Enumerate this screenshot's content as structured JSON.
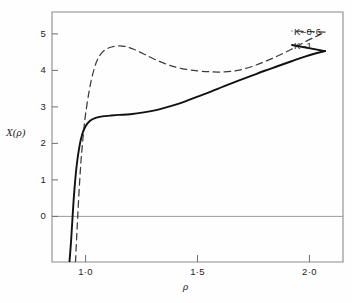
{
  "chart_data": {
    "type": "line",
    "title": "",
    "subtitle": "",
    "xlabel": "ρ",
    "ylabel": "X(ρ)",
    "xlim": [
      0.85,
      2.15
    ],
    "ylim": [
      -1.25,
      5.6
    ],
    "grid": false,
    "legend_position": "inside-top-right",
    "zero_line": true,
    "xticks": [
      {
        "value": 1.0,
        "label": "1·0"
      },
      {
        "value": 1.5,
        "label": "1·5"
      },
      {
        "value": 2.0,
        "label": "2·0"
      }
    ],
    "yticks": [
      {
        "value": 0,
        "label": "0"
      },
      {
        "value": 1,
        "label": "1"
      },
      {
        "value": 2,
        "label": "2"
      },
      {
        "value": 3,
        "label": "3"
      },
      {
        "value": 4,
        "label": "4"
      },
      {
        "value": 5,
        "label": "5"
      }
    ],
    "series": [
      {
        "name": "K=0·6",
        "label": "K–0·6",
        "style": "dashed",
        "color": "#3b3b3b",
        "points": [
          [
            0.955,
            -1.25
          ],
          [
            0.96,
            -0.6
          ],
          [
            0.965,
            0.0
          ],
          [
            0.972,
            0.8
          ],
          [
            0.98,
            1.55
          ],
          [
            0.99,
            2.25
          ],
          [
            1.0,
            2.8
          ],
          [
            1.015,
            3.4
          ],
          [
            1.03,
            3.85
          ],
          [
            1.05,
            4.25
          ],
          [
            1.075,
            4.5
          ],
          [
            1.105,
            4.62
          ],
          [
            1.14,
            4.67
          ],
          [
            1.175,
            4.66
          ],
          [
            1.215,
            4.58
          ],
          [
            1.26,
            4.45
          ],
          [
            1.31,
            4.3
          ],
          [
            1.37,
            4.15
          ],
          [
            1.43,
            4.05
          ],
          [
            1.5,
            3.99
          ],
          [
            1.56,
            3.96
          ],
          [
            1.62,
            3.96
          ],
          [
            1.68,
            4.0
          ],
          [
            1.74,
            4.1
          ],
          [
            1.8,
            4.24
          ],
          [
            1.86,
            4.4
          ],
          [
            1.92,
            4.58
          ],
          [
            1.98,
            4.78
          ],
          [
            2.03,
            4.93
          ],
          [
            2.07,
            5.05
          ]
        ]
      },
      {
        "name": "K=1",
        "label": "K–1",
        "style": "solid",
        "color": "#111111",
        "points": [
          [
            0.928,
            -1.25
          ],
          [
            0.935,
            -0.7
          ],
          [
            0.942,
            0.0
          ],
          [
            0.95,
            0.72
          ],
          [
            0.96,
            1.38
          ],
          [
            0.972,
            1.9
          ],
          [
            0.985,
            2.25
          ],
          [
            1.0,
            2.47
          ],
          [
            1.02,
            2.62
          ],
          [
            1.045,
            2.7
          ],
          [
            1.075,
            2.74
          ],
          [
            1.11,
            2.76
          ],
          [
            1.15,
            2.78
          ],
          [
            1.2,
            2.8
          ],
          [
            1.26,
            2.85
          ],
          [
            1.32,
            2.92
          ],
          [
            1.38,
            3.02
          ],
          [
            1.44,
            3.14
          ],
          [
            1.5,
            3.28
          ],
          [
            1.56,
            3.42
          ],
          [
            1.62,
            3.57
          ],
          [
            1.68,
            3.71
          ],
          [
            1.74,
            3.85
          ],
          [
            1.8,
            3.99
          ],
          [
            1.86,
            4.12
          ],
          [
            1.92,
            4.25
          ],
          [
            1.98,
            4.38
          ],
          [
            2.03,
            4.47
          ],
          [
            2.07,
            4.53
          ]
        ]
      }
    ]
  },
  "axes": {
    "y_axis_title": "X(ρ)",
    "x_axis_title": "ρ"
  },
  "legend": {
    "items": [
      {
        "label": "K–0·6"
      },
      {
        "label": "K–1"
      }
    ]
  },
  "colors": {
    "frame": "#8a8a8a",
    "zero_line": "#9a9a9a",
    "solid_curve": "#111111",
    "dashed_curve": "#3b3b3b",
    "text": "#1f1f1f",
    "background": "#fefefe"
  }
}
